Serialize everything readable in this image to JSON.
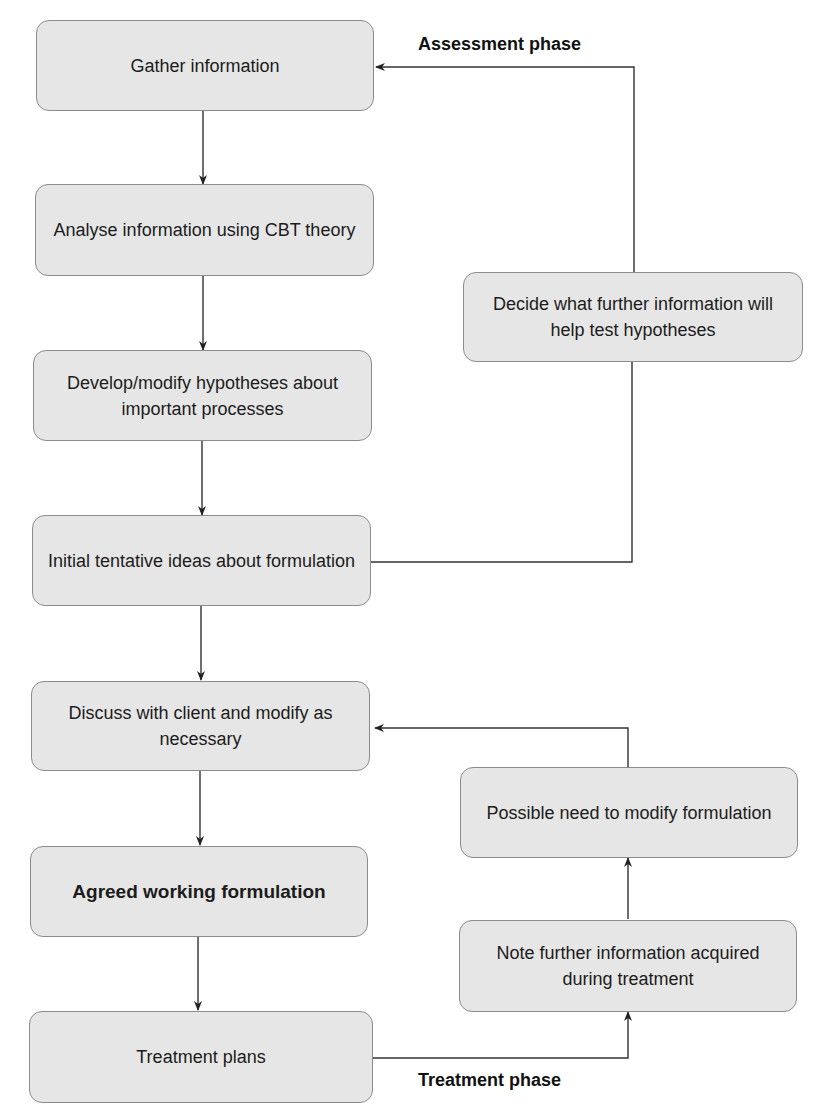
{
  "diagram": {
    "left_column": [
      {
        "id": "gather",
        "text": "Gather information",
        "bold": false
      },
      {
        "id": "analyse",
        "text": "Analyse information using CBT theory",
        "bold": false
      },
      {
        "id": "develop",
        "text": "Develop/modify hypotheses about important processes",
        "bold": false
      },
      {
        "id": "initial",
        "text": "Initial tentative ideas about formulation",
        "bold": false
      },
      {
        "id": "discuss",
        "text": "Discuss with client and modify as necessary",
        "bold": false
      },
      {
        "id": "agreed",
        "text": "Agreed working formulation",
        "bold": true
      },
      {
        "id": "treatment",
        "text": "Treatment plans",
        "bold": false
      }
    ],
    "right_column": [
      {
        "id": "decide",
        "text": "Decide what further information will help test hypotheses"
      },
      {
        "id": "possible",
        "text": "Possible need to modify formulation"
      },
      {
        "id": "note",
        "text": "Note further information acquired during treatment"
      }
    ],
    "phase_labels": {
      "assessment": "Assessment phase",
      "treatment": "Treatment phase"
    },
    "edges": [
      {
        "from": "gather",
        "to": "analyse"
      },
      {
        "from": "analyse",
        "to": "develop"
      },
      {
        "from": "develop",
        "to": "initial"
      },
      {
        "from": "initial",
        "to": "discuss"
      },
      {
        "from": "discuss",
        "to": "agreed"
      },
      {
        "from": "agreed",
        "to": "treatment"
      },
      {
        "from": "initial",
        "to": "decide"
      },
      {
        "from": "decide",
        "to": "gather"
      },
      {
        "from": "treatment",
        "to": "note"
      },
      {
        "from": "note",
        "to": "possible"
      },
      {
        "from": "possible",
        "to": "discuss"
      }
    ],
    "colors": {
      "box_fill": "#e6e6e6",
      "box_border": "#8c8c8c",
      "line": "#333333",
      "text": "#1c1c1c"
    }
  }
}
